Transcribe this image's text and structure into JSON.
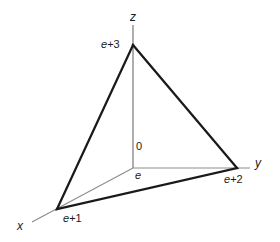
{
  "figure": {
    "type": "3d-coordinate-diagram",
    "background_color": "#ffffff",
    "axis_color": "#8c8c8c",
    "edge_color": "#1a1a1a",
    "text_color": "#1a1a1a",
    "axes": [
      {
        "name": "x",
        "label": "x"
      },
      {
        "name": "y",
        "label": "y"
      },
      {
        "name": "z",
        "label": "z"
      }
    ],
    "origin": {
      "label": "e",
      "zero_label": "0"
    },
    "intercepts": [
      {
        "axis": "x",
        "label_prefix": "e",
        "label_suffix": "+1",
        "label": "e+1"
      },
      {
        "axis": "y",
        "label_prefix": "e",
        "label_suffix": "+2",
        "label": "e+2"
      },
      {
        "axis": "z",
        "label_prefix": "e",
        "label_suffix": "+3",
        "label": "e+3"
      }
    ],
    "geometry": {
      "origin_point": [
        133,
        168
      ],
      "z_intercept_point": [
        133,
        45
      ],
      "y_intercept_point": [
        237,
        168
      ],
      "x_intercept_point": [
        57,
        209
      ],
      "z_axis_top": [
        133,
        25
      ],
      "y_axis_end": [
        250,
        168
      ],
      "x_axis_end": [
        32,
        222
      ],
      "triangle_path": "M133,45 L237,168 L57,209 Z"
    }
  }
}
